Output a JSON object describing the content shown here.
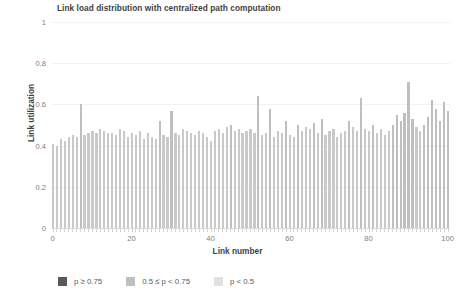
{
  "chart_data": {
    "type": "bar",
    "title": "Link load distribution with centralized path computation",
    "xlabel": "Link number",
    "ylabel": "Link utilization",
    "xlim": [
      0,
      101
    ],
    "ylim": [
      0,
      1
    ],
    "xticks": [
      0,
      20,
      40,
      60,
      80,
      100
    ],
    "yticks": [
      "0",
      "0.2",
      "0.4",
      "0.6",
      "0.8",
      "1"
    ],
    "grid": true,
    "legend_position": "bottom-left",
    "legend": [
      {
        "label": "p ≥ 0.75",
        "color": "#595959"
      },
      {
        "label": "0.5 ≤ p < 0.75",
        "color": "#bfbfbf"
      },
      {
        "label": "p < 0.5",
        "color": "#e0e0e0"
      }
    ],
    "x": [
      0,
      1,
      2,
      3,
      4,
      5,
      6,
      7,
      8,
      9,
      10,
      11,
      12,
      13,
      14,
      15,
      16,
      17,
      18,
      19,
      20,
      21,
      22,
      23,
      24,
      25,
      26,
      27,
      28,
      29,
      30,
      31,
      32,
      33,
      34,
      35,
      36,
      37,
      38,
      39,
      40,
      41,
      42,
      43,
      44,
      45,
      46,
      47,
      48,
      49,
      50,
      51,
      52,
      53,
      54,
      55,
      56,
      57,
      58,
      59,
      60,
      61,
      62,
      63,
      64,
      65,
      66,
      67,
      68,
      69,
      70,
      71,
      72,
      73,
      74,
      75,
      76,
      77,
      78,
      79,
      80,
      81,
      82,
      83,
      84,
      85,
      86,
      87,
      88,
      89,
      90,
      91,
      92,
      93,
      94,
      95,
      96,
      97,
      98,
      99,
      100
    ],
    "values": [
      0.41,
      0.4,
      0.43,
      0.42,
      0.44,
      0.45,
      0.44,
      0.6,
      0.45,
      0.46,
      0.47,
      0.46,
      0.48,
      0.47,
      0.46,
      0.46,
      0.45,
      0.48,
      0.47,
      0.44,
      0.46,
      0.45,
      0.47,
      0.43,
      0.46,
      0.44,
      0.43,
      0.52,
      0.45,
      0.44,
      0.57,
      0.46,
      0.45,
      0.48,
      0.47,
      0.46,
      0.45,
      0.47,
      0.46,
      0.44,
      0.42,
      0.47,
      0.48,
      0.46,
      0.49,
      0.5,
      0.47,
      0.48,
      0.46,
      0.47,
      0.48,
      0.46,
      0.64,
      0.45,
      0.46,
      0.58,
      0.44,
      0.47,
      0.46,
      0.52,
      0.45,
      0.44,
      0.5,
      0.47,
      0.49,
      0.48,
      0.51,
      0.46,
      0.53,
      0.45,
      0.47,
      0.48,
      0.44,
      0.46,
      0.47,
      0.52,
      0.49,
      0.47,
      0.63,
      0.48,
      0.47,
      0.5,
      0.46,
      0.48,
      0.45,
      0.47,
      0.5,
      0.55,
      0.52,
      0.56,
      0.71,
      0.53,
      0.49,
      0.47,
      0.5,
      0.54,
      0.62,
      0.58,
      0.52,
      0.61,
      0.57
    ]
  }
}
